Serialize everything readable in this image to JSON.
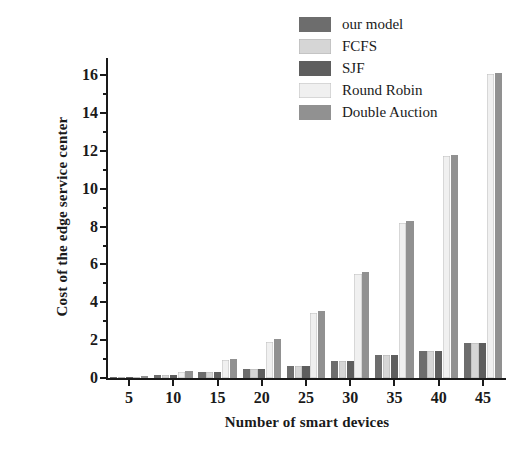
{
  "chart_data": {
    "type": "bar",
    "title": "",
    "xlabel": "Number of smart devices",
    "ylabel": "Cost of the edge service center",
    "categories": [
      "5",
      "10",
      "15",
      "20",
      "25",
      "30",
      "35",
      "40",
      "45"
    ],
    "xlim": [
      0,
      10
    ],
    "ylim": [
      0,
      16.8
    ],
    "yticks": [
      0,
      2,
      4,
      6,
      8,
      10,
      12,
      14,
      16
    ],
    "ytick_labels": [
      "0",
      "2",
      "4",
      "6",
      "8",
      "10",
      "12",
      "14",
      "16"
    ],
    "yminor_ticks": [
      1,
      3,
      5,
      7,
      9,
      11,
      13,
      15
    ],
    "grid": false,
    "legend_position": "top-right",
    "series": [
      {
        "name": "our model",
        "color": "#6d6d6d",
        "values": [
          0.05,
          0.18,
          0.3,
          0.5,
          0.65,
          0.9,
          1.2,
          1.45,
          1.85
        ]
      },
      {
        "name": "FCFS",
        "color": "#d6d6d6",
        "values": [
          0.05,
          0.18,
          0.3,
          0.5,
          0.65,
          0.9,
          1.2,
          1.45,
          1.85
        ]
      },
      {
        "name": "SJF",
        "color": "#5e5e5e",
        "values": [
          0.05,
          0.18,
          0.3,
          0.5,
          0.65,
          0.9,
          1.2,
          1.45,
          1.85
        ]
      },
      {
        "name": "Round Robin",
        "color": "#f0f0f0",
        "values": [
          0.08,
          0.3,
          0.95,
          1.9,
          3.45,
          5.5,
          8.2,
          11.75,
          16.05
        ]
      },
      {
        "name": "Double Auction",
        "color": "#919191",
        "values": [
          0.1,
          0.35,
          1.0,
          2.05,
          3.55,
          5.6,
          8.3,
          11.8,
          16.1
        ]
      }
    ]
  },
  "legend": {
    "items": [
      {
        "label": "our model"
      },
      {
        "label": "FCFS"
      },
      {
        "label": "SJF"
      },
      {
        "label": "Round Robin"
      },
      {
        "label": "Double Auction"
      }
    ]
  },
  "colors": {
    "axis": "#1a1a1a",
    "background": "#ffffff",
    "our_model": "#6d6d6d",
    "fcfs": "#d6d6d6",
    "sjf": "#5e5e5e",
    "round_robin": "#f0f0f0",
    "double_auction": "#919191"
  }
}
